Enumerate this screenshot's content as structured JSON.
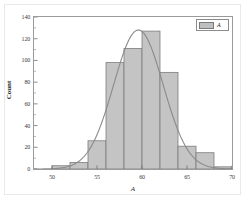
{
  "chart_data": {
    "type": "bar",
    "title": "",
    "subtitle": "",
    "xlabel": "A",
    "ylabel": "Count",
    "xlim": [
      48,
      70
    ],
    "ylim": [
      0,
      140
    ],
    "grid": false,
    "bin_width": 2,
    "legend_position": "top-right",
    "legend": [
      {
        "name": "A",
        "swatch_color": "#bfbfbf"
      }
    ],
    "x_ticks": [
      50,
      55,
      60,
      65,
      70
    ],
    "x_tick_labels": [
      "50",
      "55",
      "60",
      "65",
      "70"
    ],
    "y_ticks": [
      0,
      20,
      40,
      60,
      80,
      100,
      120,
      140
    ],
    "y_tick_labels": [
      "0",
      "20",
      "40",
      "60",
      "80",
      "100",
      "120",
      "140"
    ],
    "bin_edges": [
      50,
      52,
      54,
      56,
      58,
      60,
      62,
      64,
      66,
      68,
      70
    ],
    "categories": [
      "50-52",
      "52-54",
      "54-56",
      "56-58",
      "58-60",
      "60-62",
      "62-64",
      "64-66",
      "66-68",
      "68-70"
    ],
    "values": [
      3,
      6,
      26,
      98,
      111,
      127,
      89,
      21,
      15,
      2
    ],
    "series": [
      {
        "name": "A",
        "type": "bar",
        "values": [
          3,
          6,
          26,
          98,
          111,
          127,
          89,
          21,
          15,
          2
        ],
        "fill_color": "#c4c4c4",
        "edge_color": "#7d7d7d"
      },
      {
        "name": "fit-curve",
        "type": "line",
        "line_color": "#8a8a8a",
        "mean": 59.6,
        "sigma": 2.75,
        "peak_value": 128,
        "x": [
          48,
          49,
          50,
          51,
          52,
          53,
          54,
          55,
          56,
          57,
          58,
          59,
          60,
          61,
          62,
          63,
          64,
          65,
          66,
          67,
          68,
          69,
          70
        ],
        "values": [
          0.4,
          0.9,
          2.0,
          4.2,
          8.2,
          15.0,
          25.5,
          40.5,
          60.0,
          83.0,
          105.0,
          122.0,
          128.0,
          122.0,
          105.0,
          83.0,
          60.0,
          40.5,
          25.5,
          15.0,
          8.2,
          4.2,
          2.0
        ]
      }
    ]
  },
  "figure": {
    "background_color": "#ffffff",
    "frame_color": "#9a9a9a"
  }
}
